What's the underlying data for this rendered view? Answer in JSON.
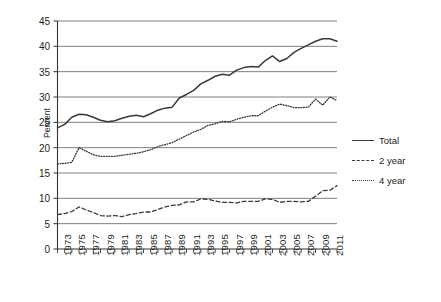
{
  "chart_data": {
    "type": "line",
    "title": "",
    "xlabel": "",
    "ylabel": "Percent",
    "ylim": [
      0,
      45
    ],
    "ytick_step": 5,
    "yticks": [
      0,
      5,
      10,
      15,
      20,
      25,
      30,
      35,
      40,
      45
    ],
    "grid": true,
    "grid_axis": "y",
    "legend_position": "right",
    "xlim": [
      1973,
      2012
    ],
    "x": [
      1973,
      1974,
      1975,
      1976,
      1977,
      1978,
      1979,
      1980,
      1981,
      1982,
      1983,
      1984,
      1985,
      1986,
      1987,
      1988,
      1989,
      1990,
      1991,
      1992,
      1993,
      1994,
      1995,
      1996,
      1997,
      1998,
      1999,
      2000,
      2001,
      2002,
      2003,
      2004,
      2005,
      2006,
      2007,
      2008,
      2009,
      2010,
      2011,
      2012
    ],
    "xticks": [
      1973,
      1975,
      1977,
      1979,
      1981,
      1983,
      1985,
      1987,
      1989,
      1991,
      1993,
      1995,
      1997,
      1999,
      2001,
      2003,
      2005,
      2007,
      2009,
      2011
    ],
    "xtick_labels": [
      "1973",
      "1975",
      "1977",
      "1979",
      "1981",
      "1983",
      "1985",
      "1987",
      "1989",
      "1991",
      "1993",
      "1995",
      "1997",
      "1999",
      "2001",
      "2003",
      "2005",
      "2007",
      "2009",
      "2011"
    ],
    "series": [
      {
        "name": "Total",
        "style": "solid",
        "color": "#3a3a3a",
        "values": [
          23.9,
          24.6,
          26.0,
          26.6,
          26.5,
          26.0,
          25.4,
          25.1,
          25.3,
          25.8,
          26.2,
          26.4,
          26.1,
          26.7,
          27.4,
          27.8,
          28.0,
          29.8,
          30.5,
          31.3,
          32.6,
          33.3,
          34.1,
          34.5,
          34.3,
          35.3,
          35.8,
          36.0,
          35.9,
          37.2,
          38.1,
          37.0,
          37.6,
          38.8,
          39.6,
          40.3,
          41.0,
          41.5,
          41.5,
          41.0
        ]
      },
      {
        "name": "2 year",
        "style": "dashed",
        "color": "#3a3a3a",
        "values": [
          6.8,
          7.0,
          7.4,
          8.3,
          7.7,
          7.2,
          6.6,
          6.5,
          6.6,
          6.4,
          6.8,
          7.0,
          7.3,
          7.3,
          7.8,
          8.3,
          8.6,
          8.7,
          9.3,
          9.3,
          9.9,
          9.8,
          9.5,
          9.2,
          9.2,
          9.1,
          9.4,
          9.4,
          9.4,
          9.9,
          9.8,
          9.2,
          9.4,
          9.4,
          9.3,
          9.4,
          10.4,
          11.5,
          11.6,
          12.5
        ]
      },
      {
        "name": "4 year",
        "style": "dotted",
        "color": "#3a3a3a",
        "values": [
          16.8,
          16.9,
          17.1,
          20.0,
          19.3,
          18.6,
          18.3,
          18.3,
          18.3,
          18.5,
          18.7,
          18.9,
          19.2,
          19.6,
          20.2,
          20.6,
          21.0,
          21.7,
          22.4,
          23.1,
          23.6,
          24.4,
          24.7,
          25.2,
          25.1,
          25.6,
          26.0,
          26.3,
          26.3,
          27.2,
          28.0,
          28.6,
          28.3,
          27.9,
          27.9,
          28.0,
          29.6,
          28.4,
          30.0,
          29.3
        ]
      }
    ]
  },
  "legend": {
    "items": [
      {
        "label": "Total"
      },
      {
        "label": "2 year"
      },
      {
        "label": "4 year"
      }
    ]
  }
}
